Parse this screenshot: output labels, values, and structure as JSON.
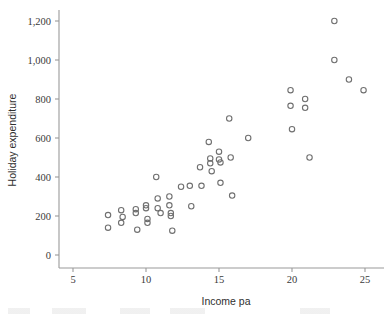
{
  "chart_data": {
    "type": "scatter",
    "title": "",
    "xlabel": "Income pa",
    "ylabel": "Holiday expenditure",
    "xlim": [
      3.6,
      26.4
    ],
    "ylim": [
      -60,
      1290
    ],
    "grid": false,
    "legend": null,
    "xticks": [
      "5",
      "10",
      "15",
      "20",
      "25"
    ],
    "xtick_values": [
      5,
      10,
      15,
      20,
      25
    ],
    "yticks": [
      "0",
      "200",
      "400",
      "600",
      "800",
      "1,000",
      "1,200"
    ],
    "ytick_values": [
      0,
      200,
      400,
      600,
      800,
      1000,
      1200
    ],
    "marker": "open-circle",
    "marker_color": "#707070",
    "n_points": 46,
    "points": [
      {
        "x": 7.4,
        "y": 205
      },
      {
        "x": 7.4,
        "y": 140
      },
      {
        "x": 8.3,
        "y": 230
      },
      {
        "x": 8.3,
        "y": 165
      },
      {
        "x": 8.4,
        "y": 195
      },
      {
        "x": 9.3,
        "y": 235
      },
      {
        "x": 9.3,
        "y": 215
      },
      {
        "x": 9.4,
        "y": 130
      },
      {
        "x": 10.0,
        "y": 255
      },
      {
        "x": 10.0,
        "y": 240
      },
      {
        "x": 10.1,
        "y": 185
      },
      {
        "x": 10.1,
        "y": 165
      },
      {
        "x": 10.7,
        "y": 400
      },
      {
        "x": 10.8,
        "y": 290
      },
      {
        "x": 10.8,
        "y": 240
      },
      {
        "x": 11.0,
        "y": 215
      },
      {
        "x": 11.6,
        "y": 300
      },
      {
        "x": 11.6,
        "y": 255
      },
      {
        "x": 11.7,
        "y": 215
      },
      {
        "x": 11.7,
        "y": 200
      },
      {
        "x": 11.8,
        "y": 125
      },
      {
        "x": 12.4,
        "y": 350
      },
      {
        "x": 13.0,
        "y": 355
      },
      {
        "x": 13.1,
        "y": 250
      },
      {
        "x": 13.7,
        "y": 450
      },
      {
        "x": 13.8,
        "y": 355
      },
      {
        "x": 14.3,
        "y": 580
      },
      {
        "x": 14.4,
        "y": 495
      },
      {
        "x": 14.4,
        "y": 470
      },
      {
        "x": 14.5,
        "y": 430
      },
      {
        "x": 15.0,
        "y": 530
      },
      {
        "x": 15.0,
        "y": 490
      },
      {
        "x": 15.1,
        "y": 475
      },
      {
        "x": 15.1,
        "y": 370
      },
      {
        "x": 15.7,
        "y": 700
      },
      {
        "x": 15.8,
        "y": 500
      },
      {
        "x": 15.9,
        "y": 305
      },
      {
        "x": 17.0,
        "y": 600
      },
      {
        "x": 19.9,
        "y": 845
      },
      {
        "x": 19.9,
        "y": 765
      },
      {
        "x": 20.0,
        "y": 645
      },
      {
        "x": 20.9,
        "y": 800
      },
      {
        "x": 20.9,
        "y": 755
      },
      {
        "x": 21.2,
        "y": 500
      },
      {
        "x": 22.9,
        "y": 1200
      },
      {
        "x": 22.9,
        "y": 1000
      },
      {
        "x": 23.9,
        "y": 900
      },
      {
        "x": 24.9,
        "y": 845
      }
    ]
  }
}
